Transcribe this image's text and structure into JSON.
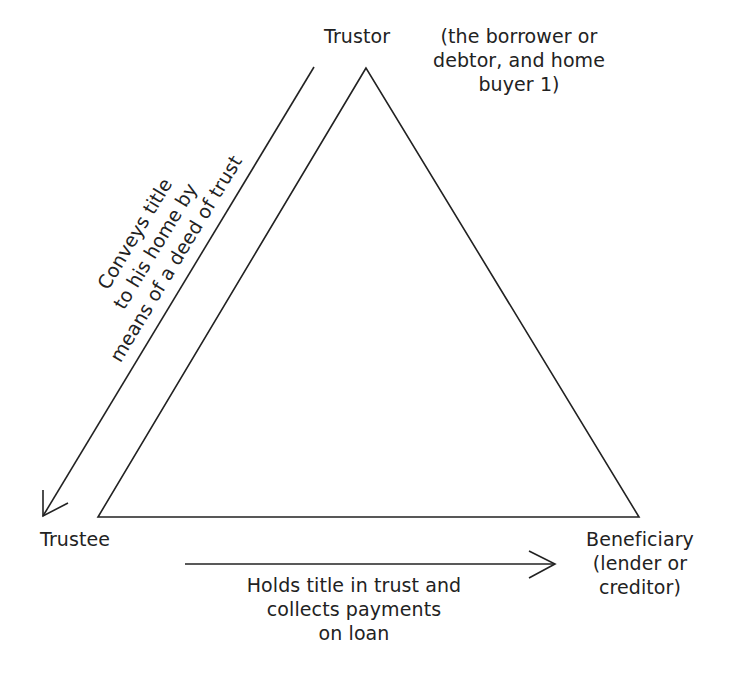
{
  "diagram": {
    "nodes": {
      "trustor": {
        "label": "Trustor",
        "note_lines": [
          "(the borrower or",
          "debtor, and home",
          "buyer 1)"
        ]
      },
      "trustee": {
        "label": "Trustee"
      },
      "beneficiary": {
        "lines": [
          "Beneficiary",
          "(lender or",
          "creditor)"
        ]
      }
    },
    "edges": [
      {
        "from": "trustor",
        "to": "trustee",
        "caption_lines": [
          "Conveys title",
          "to his home by",
          "means of a deed of trust"
        ]
      },
      {
        "from": "trustee",
        "to": "beneficiary",
        "caption_lines": [
          "Holds title in trust and",
          "collects payments",
          "on loan"
        ]
      }
    ],
    "colors": {
      "ink": "#222222",
      "background": "#ffffff"
    }
  }
}
